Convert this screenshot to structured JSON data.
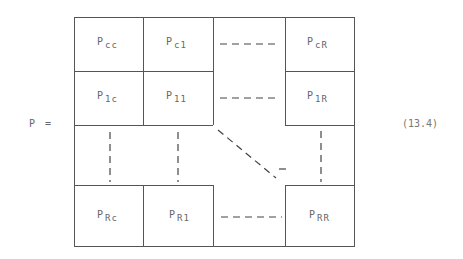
{
  "equation": {
    "lhs": "P =",
    "number": "(13.4)"
  },
  "matrix": {
    "rows": [
      [
        {
          "base": "P",
          "sub": "cc"
        },
        {
          "base": "P",
          "sub": "c1"
        },
        {
          "type": "hdots"
        },
        {
          "base": "P",
          "sub": "cR"
        }
      ],
      [
        {
          "base": "P",
          "sub": "1c"
        },
        {
          "base": "P",
          "sub": "11"
        },
        {
          "type": "hdots"
        },
        {
          "base": "P",
          "sub": "1R"
        }
      ],
      [
        {
          "type": "vdots"
        },
        {
          "type": "vdots"
        },
        {
          "type": "ddots"
        },
        {
          "type": "vdots"
        }
      ],
      [
        {
          "base": "P",
          "sub": "Rc"
        },
        {
          "base": "P",
          "sub": "R1"
        },
        {
          "type": "hdots"
        },
        {
          "base": "P",
          "sub": "RR"
        }
      ]
    ]
  },
  "cells": {
    "cc": {
      "base": "P",
      "sub": "cc"
    },
    "c1": {
      "base": "P",
      "sub": "c1"
    },
    "cR": {
      "base": "P",
      "sub": "cR"
    },
    "lc": {
      "base": "P",
      "sub": "1c"
    },
    "l1": {
      "base": "P",
      "sub": "11"
    },
    "lR": {
      "base": "P",
      "sub": "1R"
    },
    "Rc": {
      "base": "P",
      "sub": "Rc"
    },
    "R1": {
      "base": "P",
      "sub": "R1"
    },
    "RR": {
      "base": "P",
      "sub": "RR"
    }
  }
}
